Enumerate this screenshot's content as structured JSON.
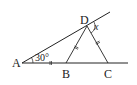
{
  "diagram": {
    "points": {
      "A": {
        "label": "A",
        "x": 22,
        "y": 63
      },
      "B": {
        "label": "B",
        "x": 66,
        "y": 63
      },
      "C": {
        "label": "C",
        "x": 108,
        "y": 63
      },
      "D": {
        "label": "D",
        "x": 87,
        "y": 26
      }
    },
    "angle_A_label": "30°",
    "angle_x_label": "x",
    "stroke_color": "#222222"
  }
}
